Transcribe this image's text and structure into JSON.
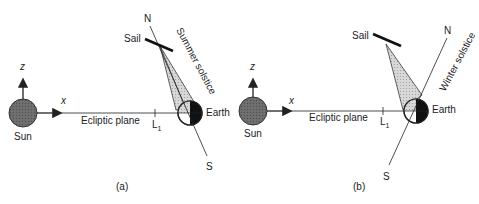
{
  "panels": [
    {
      "id": "a",
      "caption": "(a)",
      "sun_label": "Sun",
      "z_label": "z",
      "x_label": "x",
      "plane_label": "Ecliptic plane",
      "l1_label": "L",
      "l1_sub": "1",
      "earth_label": "Earth",
      "sail_label": "Sail",
      "north_label": "N",
      "south_label": "S",
      "season_label": "Summer solstice"
    },
    {
      "id": "b",
      "caption": "(b)",
      "sun_label": "Sun",
      "z_label": "z",
      "x_label": "x",
      "plane_label": "Ecliptic plane",
      "l1_label": "L",
      "l1_sub": "1",
      "earth_label": "Earth",
      "sail_label": "Sail",
      "north_label": "N",
      "south_label": "S",
      "season_label": "Winter solstice"
    }
  ],
  "colors": {
    "line": "#222222",
    "sun_fill": "#6a6a6a",
    "cone_fill": "#d4d4d4",
    "earth_dark": "#111111"
  }
}
